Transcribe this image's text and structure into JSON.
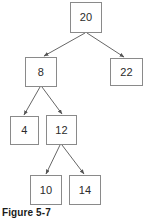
{
  "figure": {
    "caption": "Figure 5-7",
    "type": "binary-search-tree-diagram",
    "background_color": "#ffffff",
    "node_border_color": "#8a8a8a",
    "node_fill_color": "#ffffff",
    "text_color": "#2b2b2b",
    "edge_color": "#555555"
  },
  "chart_data": {
    "type": "diagram",
    "title": "Figure 5-7",
    "structure": "binary search tree",
    "nodes": [
      {
        "id": "n20",
        "label": "20",
        "x": 70,
        "y": 2,
        "w": 32,
        "h": 31,
        "level": 0
      },
      {
        "id": "n8",
        "label": "8",
        "x": 25,
        "y": 57,
        "w": 32,
        "h": 30,
        "level": 1
      },
      {
        "id": "n22",
        "label": "22",
        "x": 110,
        "y": 58,
        "w": 33,
        "h": 28,
        "level": 1
      },
      {
        "id": "n4",
        "label": "4",
        "x": 10,
        "y": 116,
        "w": 29,
        "h": 29,
        "level": 2
      },
      {
        "id": "n12",
        "label": "12",
        "x": 46,
        "y": 115,
        "w": 31,
        "h": 30,
        "level": 2
      },
      {
        "id": "n10",
        "label": "10",
        "x": 30,
        "y": 175,
        "w": 32,
        "h": 30,
        "level": 3
      },
      {
        "id": "n14",
        "label": "14",
        "x": 69,
        "y": 175,
        "w": 32,
        "h": 30,
        "level": 3
      }
    ],
    "edges": [
      {
        "from": "n20",
        "to": "n8",
        "x1": 85,
        "y1": 33,
        "x2": 44,
        "y2": 56
      },
      {
        "from": "n20",
        "to": "n22",
        "x1": 87,
        "y1": 33,
        "x2": 124,
        "y2": 57
      },
      {
        "from": "n8",
        "to": "n4",
        "x1": 40,
        "y1": 87,
        "x2": 24,
        "y2": 115
      },
      {
        "from": "n8",
        "to": "n12",
        "x1": 42,
        "y1": 87,
        "x2": 62,
        "y2": 114
      },
      {
        "from": "n12",
        "to": "n10",
        "x1": 60,
        "y1": 145,
        "x2": 46,
        "y2": 174
      },
      {
        "from": "n12",
        "to": "n14",
        "x1": 62,
        "y1": 145,
        "x2": 84,
        "y2": 174
      }
    ]
  }
}
